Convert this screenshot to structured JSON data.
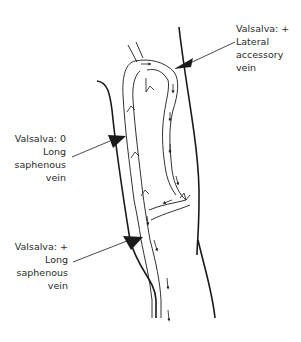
{
  "diagram": {
    "type": "anatomical-vein-diagram",
    "colors": {
      "line": "#1a1a1a",
      "text": "#2a2a2a",
      "background": "#ffffff"
    },
    "labels": [
      {
        "id": "lateral-accessory",
        "lines": [
          "Valsalva: +",
          "Lateral",
          "accessory",
          "vein"
        ]
      },
      {
        "id": "long-saphenous-upper",
        "lines": [
          "Valsalva: 0",
          "Long",
          "saphenous",
          "vein"
        ]
      },
      {
        "id": "long-saphenous-lower",
        "lines": [
          "Valsalva: +",
          "Long",
          "saphenous",
          "vein"
        ]
      }
    ]
  }
}
